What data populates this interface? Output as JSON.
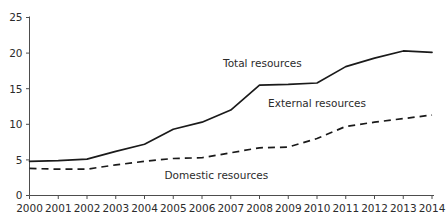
{
  "chart_data": {
    "type": "line",
    "title": "",
    "xlabel": "",
    "ylabel": "",
    "grid": false,
    "legend_position": "inline-annotations",
    "categories": [
      "2000",
      "2001",
      "2002",
      "2003",
      "2004",
      "2005",
      "2006",
      "2007",
      "2008",
      "2009",
      "2010",
      "2011",
      "2012",
      "2013",
      "2014"
    ],
    "x": [
      2000,
      2001,
      2002,
      2003,
      2004,
      2005,
      2006,
      2007,
      2008,
      2009,
      2010,
      2011,
      2012,
      2013,
      2014
    ],
    "xlim": [
      2000,
      2014
    ],
    "ylim": [
      0,
      25
    ],
    "yticks": [
      0,
      5,
      10,
      15,
      20,
      25
    ],
    "xticks": [
      "2000",
      "2001",
      "2002",
      "2003",
      "2004",
      "2005",
      "2006",
      "2007",
      "2008",
      "2009",
      "2010",
      "2011",
      "2012",
      "2013",
      "2014"
    ],
    "series": [
      {
        "name": "Total resources",
        "style": "solid",
        "color": "#1a1a1a",
        "values": [
          4.8,
          4.9,
          5.1,
          6.2,
          7.2,
          9.3,
          10.3,
          12.0,
          15.5,
          15.6,
          15.8,
          18.1,
          19.3,
          20.3,
          20.1
        ]
      },
      {
        "name": "External resources",
        "style": "dashed",
        "color": "#1a1a1a",
        "values": [
          3.8,
          3.7,
          3.7,
          4.3,
          4.8,
          5.2,
          5.3,
          6.0,
          6.7,
          6.8,
          8.0,
          9.7,
          10.3,
          10.8,
          11.3
        ]
      }
    ],
    "annotations": [
      {
        "text": "Total resources",
        "x": 2008.1,
        "y": 18.0
      },
      {
        "text": "External resources",
        "x": 2010.0,
        "y": 12.4
      },
      {
        "text": "Domestic resources",
        "x": 2006.5,
        "y": 2.3
      }
    ]
  }
}
